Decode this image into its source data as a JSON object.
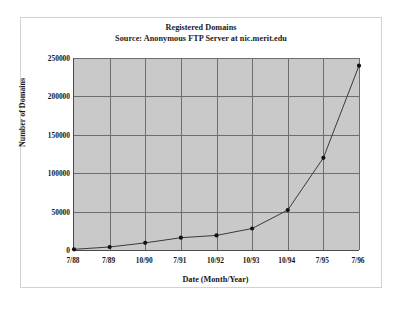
{
  "figure": {
    "background_color": "#ffffff",
    "frame_color": "#d2d2d2",
    "plot_background_color": "#c9c9c9",
    "grid_color": "#6e6e6e",
    "series_color": "#3a3a3a"
  },
  "chart_data": {
    "type": "line",
    "title": "Registered Domains",
    "subtitle": "Source: Anonymous FTP Server at nic.merit.edu",
    "xlabel": "Date (Month/Year)",
    "ylabel": "Number of Domains",
    "categories": [
      "7/88",
      "7/89",
      "10/90",
      "7/91",
      "10/92",
      "10/93",
      "10/94",
      "7/95",
      "7/96"
    ],
    "values": [
      900,
      3900,
      9300,
      16000,
      19000,
      28000,
      52000,
      120000,
      240000
    ],
    "ylim": [
      0,
      250000
    ],
    "yticks": [
      0,
      50000,
      100000,
      150000,
      200000,
      250000
    ],
    "ytick_labels": [
      "0",
      "50000",
      "100000",
      "150000",
      "200000",
      "250000"
    ],
    "grid": true,
    "legend": false,
    "marker": "circle"
  }
}
